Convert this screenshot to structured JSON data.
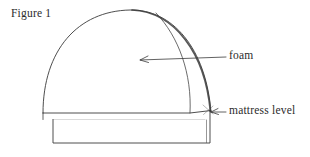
{
  "figure": {
    "caption": "Figure 1",
    "background_color": "#ffffff",
    "line_color": "#3a3a3a",
    "text_color": "#2b2b2b"
  },
  "labels": {
    "foam": "foam",
    "mattress_level": "mattress level"
  },
  "callouts": [
    {
      "label": "foam",
      "arrow_direction": "left",
      "tip_x": 140,
      "tip_y": 60,
      "tail_x": 226,
      "tail_y": 57
    },
    {
      "label": "mattress level",
      "arrow_direction": "left",
      "tip_x": 211,
      "tip_y": 112,
      "tail_x": 226,
      "tail_y": 112
    }
  ],
  "drawing": {
    "type": "line-drawing",
    "subject": "foam dome over mattress base",
    "dome_outer_arc": "M 43 113 C 43 48, 78 11, 130 10 C 172 9, 207 50, 211 112",
    "dome_outer_highlight": "M 140 11 C 178 18, 207 55, 211 112",
    "dome_inner_arc": "M 156 13 C 180 36, 192 72, 190 113",
    "mattress_line": "M 43 113 L 190 113 L 211 110",
    "base_left_edge": "M 53 120 L 53 143",
    "base_bottom_edge": "M 53 143 L 210 143",
    "base_right_edge": "M 210 143 L 210 110",
    "base_top_left_riser": "M 43 113 L 43 118",
    "base_front_top": "M 53 120 L 53 120"
  }
}
